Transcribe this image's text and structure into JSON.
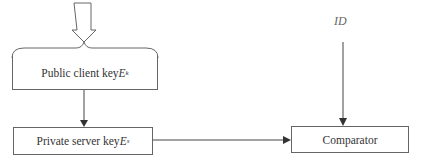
{
  "diagram": {
    "nodes": {
      "public_key": {
        "label": "Public client key ",
        "var": "E",
        "sub": "k"
      },
      "private_key": {
        "label": "Private server key ",
        "var": "E",
        "sub": "s"
      },
      "comparator": {
        "label": "Comparator"
      }
    },
    "inputs": {
      "id_label": "ID"
    },
    "edges": [
      {
        "from": "input",
        "to": "public_key",
        "style": "hollow-arrow"
      },
      {
        "from": "public_key",
        "to": "private_key",
        "style": "arrow"
      },
      {
        "from": "private_key",
        "to": "comparator",
        "style": "arrow"
      },
      {
        "from": "ID",
        "to": "comparator",
        "style": "arrow"
      }
    ],
    "colors": {
      "line": "#555555",
      "text": "#333333"
    }
  }
}
